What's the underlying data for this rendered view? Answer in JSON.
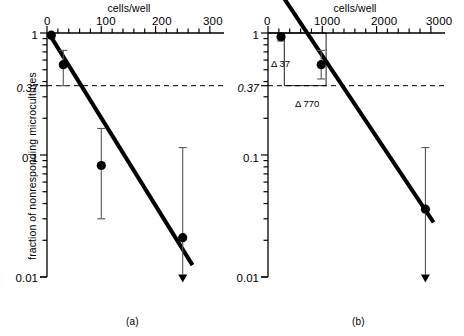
{
  "figure": {
    "ylabel": "fraction of nonresponding microcultures",
    "panels": [
      {
        "id": "a",
        "caption": "(a)",
        "xlabel": "cells/well",
        "x_ticks_major": [
          0,
          100,
          200,
          300
        ],
        "x_tick_labels": [
          "0",
          "100",
          "200",
          "300"
        ],
        "x_minor_count_per_major": 5,
        "xlim": [
          0,
          315
        ],
        "y_ticks_labeled": [
          1,
          0.37,
          0.1,
          0.01
        ],
        "y_tick_labels": [
          "1",
          "0.37",
          "0.1",
          "0.01"
        ],
        "ylim": [
          0.01,
          1
        ],
        "reference_line_y": 0.37,
        "points": [
          {
            "x": 8,
            "y": 0.96,
            "err_low": 0.9,
            "err_high": 1.0
          },
          {
            "x": 30,
            "y": 0.55,
            "err_low": 0.37,
            "err_high": 0.72
          },
          {
            "x": 100,
            "y": 0.082,
            "err_low": 0.03,
            "err_high": 0.165
          },
          {
            "x": 250,
            "y": 0.021,
            "err_low": 0.0105,
            "err_high": 0.115,
            "arrow_down": true
          }
        ],
        "fit_line": {
          "x0": 8,
          "y0": 0.92,
          "x1": 268,
          "y1": 0.0125
        }
      },
      {
        "id": "b",
        "caption": "(b)",
        "xlabel": "cells/well",
        "x_ticks_major": [
          0,
          1000,
          2000,
          3000
        ],
        "x_tick_labels": [
          "0",
          "1000",
          "2000",
          "3000"
        ],
        "x_minor_count_per_major": 5,
        "xlim": [
          0,
          3150
        ],
        "y_ticks_labeled": [
          1,
          0.37,
          0.1,
          0.01
        ],
        "y_tick_labels": [
          "1",
          "0.37",
          "0.1",
          "0.01"
        ],
        "ylim": [
          0.01,
          1
        ],
        "reference_line_y": 0.37,
        "annotations": [
          {
            "name": "delta-37",
            "text": "Δ 37",
            "x": 260,
            "y": 0.62
          },
          {
            "name": "delta-770",
            "text": "Δ 770",
            "x": 1150,
            "y": 0.3
          }
        ],
        "guide_box": {
          "x_left": 300,
          "x_right": 1070,
          "y_top": 1.0,
          "y_bottom": 0.37
        },
        "points": [
          {
            "x": 240,
            "y": 0.93,
            "err_low": 0.86,
            "err_high": 1.0
          },
          {
            "x": 980,
            "y": 0.55,
            "err_low": 0.42,
            "err_high": 0.72
          },
          {
            "x": 2900,
            "y": 0.036,
            "err_low": 0.0105,
            "err_high": 0.115,
            "arrow_down": true
          }
        ],
        "fit_line": {
          "x0": 100,
          "y0": 2.6,
          "x1": 3050,
          "y1": 0.028
        }
      }
    ]
  },
  "chart_data": {
    "type": "scatter",
    "title": "",
    "subtitle": "",
    "xlabel": "cells/well",
    "ylabel": "fraction of nonresponding microcultures",
    "grid": false,
    "legend_position": "none",
    "yscale": "log",
    "ylim": [
      0.01,
      1
    ],
    "y_tick_labels": [
      "1",
      "0.37",
      "0.1",
      "0.01"
    ],
    "reference_line_y": 0.37,
    "panels": [
      {
        "panel": "(a)",
        "xlim": [
          0,
          315
        ],
        "x_tick_labels": [
          "0",
          "100",
          "200",
          "300"
        ],
        "x": [
          8,
          30,
          100,
          250
        ],
        "y": [
          0.96,
          0.55,
          0.082,
          0.021
        ],
        "y_err_low": [
          0.9,
          0.37,
          0.03,
          0.0105
        ],
        "y_err_high": [
          1.0,
          0.72,
          0.165,
          0.115
        ],
        "fit_line_endpoints": {
          "x": [
            8,
            268
          ],
          "y": [
            0.92,
            0.0125
          ]
        },
        "annotations": []
      },
      {
        "panel": "(b)",
        "xlim": [
          0,
          3150
        ],
        "x_tick_labels": [
          "0",
          "1000",
          "2000",
          "3000"
        ],
        "x": [
          240,
          980,
          2900
        ],
        "y": [
          0.93,
          0.55,
          0.036
        ],
        "y_err_low": [
          0.86,
          0.42,
          0.0105
        ],
        "y_err_high": [
          1.0,
          0.72,
          0.115
        ],
        "fit_line_endpoints": {
          "x": [
            100,
            3050
          ],
          "y": [
            2.6,
            0.028
          ]
        },
        "annotations": [
          "Δ 37",
          "Δ 770"
        ]
      }
    ]
  }
}
